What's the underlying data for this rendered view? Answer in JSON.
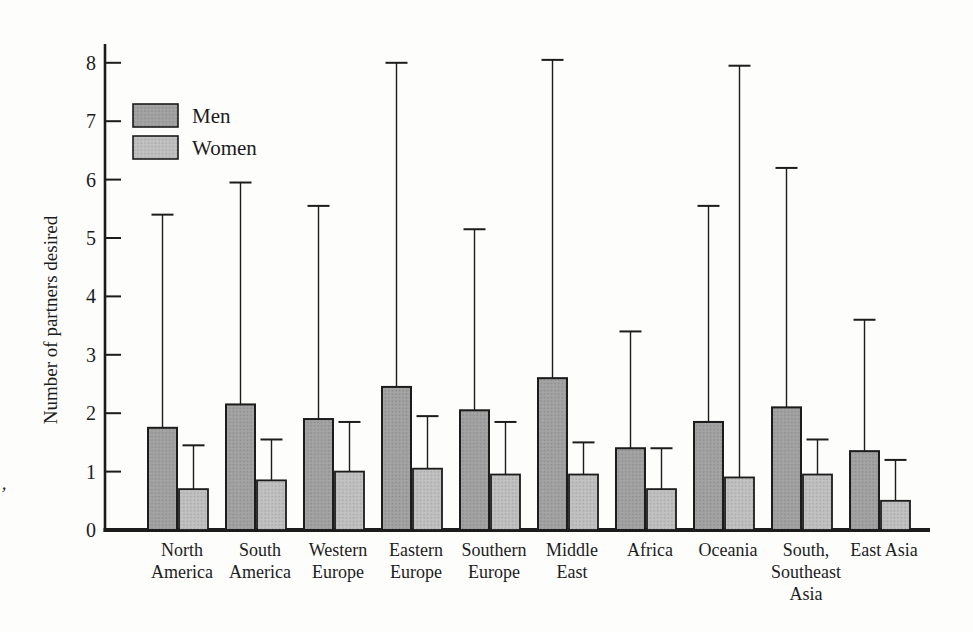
{
  "figure": {
    "artifact_mark": "’"
  },
  "colors": {
    "ink": "#1c1c1c",
    "background": "#fdfdfc",
    "men_fill": "#a4a4a4",
    "men_texture": "#8b8b8b",
    "women_fill": "#c2c2c2",
    "women_texture": "#a7a7a7"
  },
  "chart_data": {
    "type": "bar",
    "title": "",
    "xlabel": "",
    "ylabel": "Number of partners desired",
    "ylim": [
      0,
      8
    ],
    "yticks": [
      0,
      1,
      2,
      3,
      4,
      5,
      6,
      7,
      8
    ],
    "grid": false,
    "legend_position": "upper-left",
    "error_bars": "upper-only-T-cap",
    "categories": [
      "North America",
      "South America",
      "Western Europe",
      "Eastern Europe",
      "Southern Europe",
      "Middle East",
      "Africa",
      "Oceania",
      "South, Southeast Asia",
      "East Asia"
    ],
    "category_label_lines": [
      [
        "North",
        "America"
      ],
      [
        "South",
        "America"
      ],
      [
        "Western",
        "Europe"
      ],
      [
        "Eastern",
        "Europe"
      ],
      [
        "Southern",
        "Europe"
      ],
      [
        "Middle",
        "East"
      ],
      [
        "Africa"
      ],
      [
        "Oceania"
      ],
      [
        "South,",
        "Southeast",
        "Asia"
      ],
      [
        "East Asia"
      ]
    ],
    "series": [
      {
        "name": "Men",
        "values": [
          1.75,
          2.15,
          1.9,
          2.45,
          2.05,
          2.6,
          1.4,
          1.85,
          2.1,
          1.35
        ],
        "error_upper_top": [
          5.4,
          5.95,
          5.55,
          8.0,
          5.15,
          8.05,
          3.4,
          5.55,
          6.2,
          3.6
        ]
      },
      {
        "name": "Women",
        "values": [
          0.7,
          0.85,
          1.0,
          1.05,
          0.95,
          0.95,
          0.7,
          0.9,
          0.95,
          0.5
        ],
        "error_upper_top": [
          1.45,
          1.55,
          1.85,
          1.95,
          1.85,
          1.5,
          1.4,
          7.95,
          1.55,
          1.2
        ]
      }
    ]
  }
}
